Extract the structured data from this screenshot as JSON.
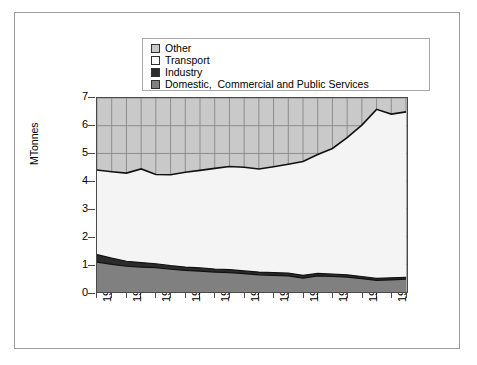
{
  "legend": {
    "items": [
      {
        "label": "Other",
        "color": "#c9c9c9",
        "swatch": "legend-swatch-other"
      },
      {
        "label": "Transport",
        "color": "#f4f4f4",
        "swatch": "legend-swatch-transport"
      },
      {
        "label": "Industry",
        "color": "#2b2b2b",
        "swatch": "legend-swatch-industry"
      },
      {
        "label": "Domestic,  Commercial and Public Services",
        "color": "#808080",
        "swatch": "legend-swatch-domestic"
      }
    ]
  },
  "chart_data": {
    "type": "area",
    "title": "",
    "xlabel": "",
    "ylabel": "MTonnes",
    "ylim": [
      0,
      7
    ],
    "yticks": [
      0,
      1,
      2,
      3,
      4,
      5,
      6,
      7
    ],
    "grid": true,
    "legend_position": "top",
    "stacked": true,
    "x": [
      1970,
      1971,
      1972,
      1973,
      1974,
      1975,
      1976,
      1977,
      1978,
      1979,
      1980,
      1981,
      1982,
      1983,
      1984,
      1985,
      1986,
      1987,
      1988,
      1989,
      1990,
      1991
    ],
    "xtick_labels": [
      "1970",
      "1972",
      "1974",
      "1976",
      "1978",
      "1980",
      "1982",
      "1984",
      "1986",
      "1988",
      "1990"
    ],
    "series": [
      {
        "name": "Domestic,  Commercial and Public Services",
        "color": "#808080",
        "values": [
          1.08,
          1.0,
          0.93,
          0.9,
          0.88,
          0.82,
          0.78,
          0.75,
          0.72,
          0.7,
          0.66,
          0.62,
          0.6,
          0.58,
          0.5,
          0.58,
          0.56,
          0.54,
          0.48,
          0.42,
          0.44,
          0.46
        ]
      },
      {
        "name": "Industry",
        "color": "#2b2b2b",
        "values": [
          0.27,
          0.22,
          0.18,
          0.16,
          0.14,
          0.13,
          0.12,
          0.12,
          0.11,
          0.11,
          0.1,
          0.1,
          0.1,
          0.1,
          0.1,
          0.09,
          0.09,
          0.08,
          0.08,
          0.07,
          0.07,
          0.07
        ]
      },
      {
        "name": "Transport",
        "color": "#f4f4f4",
        "values": [
          3.05,
          3.12,
          3.18,
          3.38,
          3.22,
          3.28,
          3.42,
          3.52,
          3.63,
          3.72,
          3.74,
          3.72,
          3.82,
          3.93,
          4.11,
          4.29,
          4.53,
          4.95,
          5.46,
          6.1,
          5.91,
          5.97
        ]
      },
      {
        "name": "Other",
        "color": "#c9c9c9",
        "values": [
          2.6,
          2.66,
          2.71,
          2.56,
          2.76,
          2.77,
          2.68,
          2.61,
          2.54,
          2.47,
          2.5,
          2.56,
          2.48,
          2.39,
          2.29,
          2.04,
          1.82,
          1.43,
          0.98,
          0.41,
          0.58,
          0.5
        ]
      }
    ],
    "totals": [
      7.0,
      7.0,
      7.0,
      7.0,
      7.0,
      7.0,
      7.0,
      7.0,
      7.0,
      7.0,
      7.0,
      7.0,
      7.0,
      7.0,
      7.0,
      7.0,
      7.0,
      7.0,
      7.0,
      7.0,
      7.0,
      7.0
    ]
  }
}
